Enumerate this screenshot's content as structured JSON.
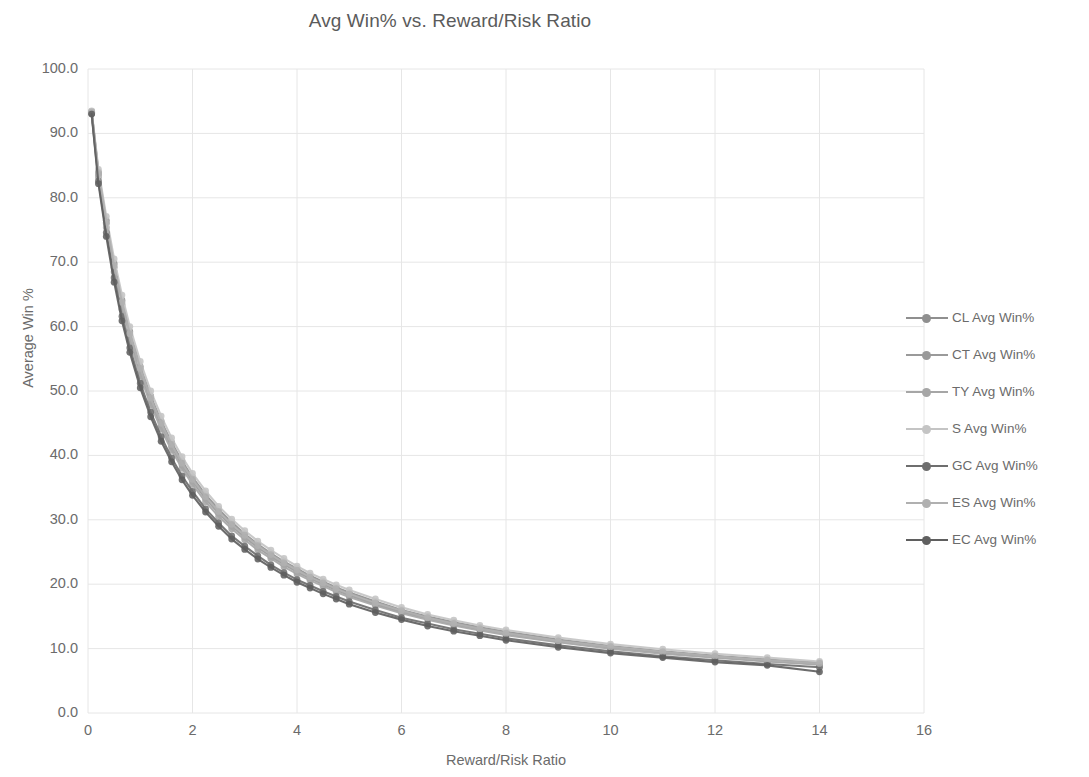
{
  "chart_data": {
    "type": "line",
    "title": "Avg Win% vs. Reward/Risk Ratio",
    "xlabel": "Reward/Risk Ratio",
    "ylabel": "Average Win %",
    "xlim": [
      0,
      16
    ],
    "ylim": [
      0,
      100
    ],
    "xticks": [
      "0",
      "2",
      "4",
      "6",
      "8",
      "10",
      "12",
      "14",
      "16"
    ],
    "yticks": [
      "0.0",
      "10.0",
      "20.0",
      "30.0",
      "40.0",
      "50.0",
      "60.0",
      "70.0",
      "80.0",
      "90.0",
      "100.0"
    ],
    "xtick_values": [
      0,
      2,
      4,
      6,
      8,
      10,
      12,
      14,
      16
    ],
    "ytick_values": [
      0,
      10,
      20,
      30,
      40,
      50,
      60,
      70,
      80,
      90,
      100
    ],
    "grid": true,
    "legend_position": "right",
    "marker": "circle",
    "x": [
      0.07,
      0.2,
      0.35,
      0.5,
      0.65,
      0.8,
      1.0,
      1.2,
      1.4,
      1.6,
      1.8,
      2.0,
      2.25,
      2.5,
      2.75,
      3.0,
      3.25,
      3.5,
      3.75,
      4.0,
      4.25,
      4.5,
      4.75,
      5.0,
      5.5,
      6.0,
      6.5,
      7.0,
      7.5,
      8.0,
      9.0,
      10.0,
      11.0,
      12.0,
      13.0,
      14.0
    ],
    "series": [
      {
        "name": "CL Avg Win%",
        "color": "#8f8f8f",
        "values": [
          93.3,
          84.0,
          76.5,
          69.8,
          64.1,
          59.2,
          53.8,
          49.2,
          45.3,
          42.0,
          39.1,
          36.6,
          33.9,
          31.6,
          29.6,
          27.8,
          26.2,
          24.8,
          23.5,
          22.4,
          21.3,
          20.4,
          19.5,
          18.7,
          17.3,
          16.0,
          15.0,
          14.1,
          13.3,
          12.6,
          11.4,
          10.4,
          9.6,
          8.9,
          8.3,
          7.8
        ]
      },
      {
        "name": "CT Avg Win%",
        "color": "#9a9a9a",
        "values": [
          93.4,
          83.6,
          76.0,
          69.2,
          63.4,
          58.5,
          53.1,
          48.5,
          44.7,
          41.4,
          38.5,
          36.0,
          33.3,
          31.0,
          29.0,
          27.3,
          25.7,
          24.3,
          23.1,
          21.9,
          20.9,
          20.0,
          19.1,
          18.3,
          16.9,
          15.7,
          14.7,
          13.8,
          13.0,
          12.3,
          11.1,
          10.2,
          9.4,
          8.7,
          8.1,
          7.6
        ]
      },
      {
        "name": "TY Avg Win%",
        "color": "#a6a6a6",
        "values": [
          93.2,
          83.2,
          75.4,
          68.5,
          62.7,
          57.8,
          52.4,
          47.9,
          44.1,
          40.8,
          38.0,
          35.5,
          32.8,
          30.5,
          28.6,
          26.9,
          25.3,
          24.0,
          22.7,
          21.6,
          20.6,
          19.7,
          18.8,
          18.0,
          16.7,
          15.5,
          14.5,
          13.6,
          12.8,
          12.1,
          11.0,
          10.0,
          9.2,
          8.6,
          8.0,
          7.5
        ]
      },
      {
        "name": "S Avg Win%",
        "color": "#c4c4c4",
        "values": [
          93.5,
          84.4,
          77.1,
          70.5,
          64.9,
          60.0,
          54.6,
          50.0,
          46.1,
          42.7,
          39.8,
          37.2,
          34.5,
          32.1,
          30.1,
          28.3,
          26.7,
          25.3,
          24.0,
          22.8,
          21.7,
          20.8,
          19.9,
          19.1,
          17.7,
          16.4,
          15.3,
          14.4,
          13.6,
          12.9,
          11.7,
          10.7,
          9.9,
          9.2,
          8.6,
          8.0
        ]
      },
      {
        "name": "GC Avg Win%",
        "color": "#6e6e6e",
        "values": [
          93.1,
          82.6,
          74.6,
          67.6,
          61.6,
          56.7,
          51.2,
          46.7,
          42.9,
          39.6,
          36.8,
          34.4,
          31.7,
          29.5,
          27.5,
          25.9,
          24.4,
          23.0,
          21.8,
          20.7,
          19.8,
          18.9,
          18.1,
          17.3,
          16.0,
          14.8,
          13.9,
          13.0,
          12.3,
          11.6,
          10.5,
          9.6,
          8.8,
          8.2,
          7.6,
          7.1
        ]
      },
      {
        "name": "ES Avg Win%",
        "color": "#b0b0b0",
        "values": [
          93.3,
          83.8,
          76.2,
          69.5,
          63.8,
          58.9,
          53.5,
          48.9,
          45.0,
          41.7,
          38.8,
          36.3,
          33.6,
          31.3,
          29.3,
          27.6,
          26.0,
          24.6,
          23.3,
          22.2,
          21.1,
          20.2,
          19.3,
          18.5,
          17.1,
          15.9,
          14.8,
          13.9,
          13.1,
          12.4,
          11.2,
          10.3,
          9.5,
          8.8,
          8.2,
          7.7
        ]
      },
      {
        "name": "EC Avg Win%",
        "color": "#5f5f5f",
        "values": [
          93.0,
          82.2,
          74.0,
          66.9,
          60.9,
          56.0,
          50.5,
          46.0,
          42.2,
          39.0,
          36.2,
          33.8,
          31.2,
          29.0,
          27.0,
          25.4,
          23.9,
          22.6,
          21.4,
          20.3,
          19.4,
          18.5,
          17.7,
          16.9,
          15.6,
          14.5,
          13.5,
          12.7,
          12.0,
          11.3,
          10.2,
          9.3,
          8.6,
          7.9,
          7.4,
          6.4
        ]
      }
    ]
  },
  "style": {
    "grid_color": "#e6e6e6",
    "text_color": "#6b6b6b",
    "title_color": "#5b5b5b",
    "background": "#ffffff"
  }
}
